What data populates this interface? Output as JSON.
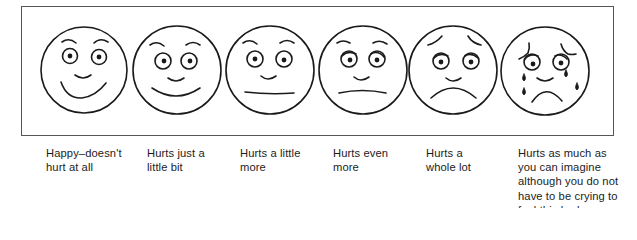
{
  "scale": [
    {
      "id": 0,
      "face": "happy-face",
      "label": "Happy–doesn't\nhurt at all"
    },
    {
      "id": 1,
      "face": "slight-smile-face",
      "label": "Hurts just a\nlittle bit"
    },
    {
      "id": 2,
      "face": "neutral-face",
      "label": "Hurts a little\nmore"
    },
    {
      "id": 3,
      "face": "slight-frown-face",
      "label": "Hurts even\nmore"
    },
    {
      "id": 4,
      "face": "sad-face",
      "label": "Hurts a\nwhole lot"
    },
    {
      "id": 5,
      "face": "crying-face",
      "label": "Hurts as much as\nyou can imagine\nalthough you do not\nhave to be crying to\nfeel this bad"
    }
  ],
  "colors": {
    "stroke": "#1a1a1a",
    "frame": "#555555",
    "background": "#ffffff"
  }
}
